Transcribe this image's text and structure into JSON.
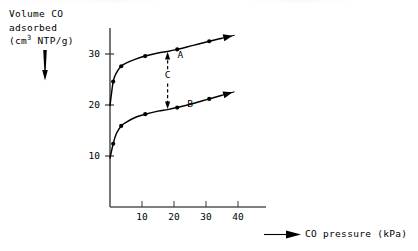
{
  "figure": {
    "ylabel_lines": [
      "Volume CO",
      "adsorbed",
      "(cm",
      "3",
      " NTP/g)"
    ],
    "ylabel_l1": "Volume CO",
    "ylabel_l2": "adsorbed",
    "ylabel_l3_pre": "(cm",
    "ylabel_l3_sup": "3",
    "ylabel_l3_post": " NTP/g)",
    "xaxis_title": "CO pressure (kPa)",
    "down_arrow_icon": "down-arrow",
    "right_arrow_icon": "right-arrow"
  },
  "chart_data": {
    "type": "line",
    "title": "",
    "xlabel": "CO pressure (kPa)",
    "ylabel": "Volume CO adsorbed (cm3 NTP/g)",
    "xlim": [
      0,
      48
    ],
    "ylim": [
      0,
      36
    ],
    "xticks": [
      10,
      20,
      30,
      40
    ],
    "xtick_labels": [
      "10",
      "20",
      "30",
      "40"
    ],
    "yticks": [
      10,
      20,
      30
    ],
    "ytick_labels": [
      "10",
      "20",
      "30"
    ],
    "grid": false,
    "legend": "inline-labels",
    "series": [
      {
        "name": "A",
        "label": "A",
        "label_x": 22.0,
        "label_y": 29.3,
        "marker": "filled-circle",
        "arrow_end": true,
        "points": [
          {
            "x": 0.0,
            "y": 19.9
          },
          {
            "x": 1.0,
            "y": 24.6
          },
          {
            "x": 2.0,
            "y": 26.3
          },
          {
            "x": 3.5,
            "y": 27.6
          },
          {
            "x": 5.0,
            "y": 28.2
          },
          {
            "x": 8.0,
            "y": 29.0
          },
          {
            "x": 11.0,
            "y": 29.6
          },
          {
            "x": 15.0,
            "y": 30.2
          },
          {
            "x": 18.0,
            "y": 30.5
          },
          {
            "x": 21.0,
            "y": 30.9
          },
          {
            "x": 26.0,
            "y": 31.7
          },
          {
            "x": 31.0,
            "y": 32.5
          },
          {
            "x": 35.0,
            "y": 33.1
          }
        ]
      },
      {
        "name": "B",
        "label": "B",
        "label_x": 25.0,
        "label_y": 19.6,
        "marker": "filled-circle",
        "arrow_end": true,
        "points": [
          {
            "x": 0.0,
            "y": 9.6
          },
          {
            "x": 1.0,
            "y": 12.4
          },
          {
            "x": 2.0,
            "y": 14.4
          },
          {
            "x": 3.5,
            "y": 15.9
          },
          {
            "x": 5.0,
            "y": 16.6
          },
          {
            "x": 8.0,
            "y": 17.6
          },
          {
            "x": 11.0,
            "y": 18.2
          },
          {
            "x": 15.0,
            "y": 18.8
          },
          {
            "x": 18.0,
            "y": 19.1
          },
          {
            "x": 21.0,
            "y": 19.5
          },
          {
            "x": 26.0,
            "y": 20.3
          },
          {
            "x": 31.0,
            "y": 21.2
          },
          {
            "x": 35.0,
            "y": 21.9
          }
        ]
      }
    ],
    "annotations": [
      {
        "name": "C",
        "label": "C",
        "type": "double-arrow-dashed",
        "x": 18.0,
        "y_bottom": 19.1,
        "y_top": 30.5,
        "label_x": 18.0,
        "label_y": 25.3
      }
    ]
  }
}
